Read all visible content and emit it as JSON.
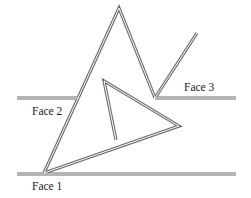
{
  "diagram": {
    "type": "line-drawing",
    "colors": {
      "line_outer": "#6b6b6b",
      "line_inner": "#ffffff",
      "text": "#1a1a1a",
      "background": "#ffffff"
    },
    "labels": {
      "face1": "Face 1",
      "face2": "Face 2",
      "face3": "Face 3"
    },
    "faces": [
      {
        "name": "Face 1",
        "x1": 17,
        "y1": 174,
        "x2": 236,
        "y2": 174
      },
      {
        "name": "Face 2",
        "x1": 17,
        "y1": 98,
        "x2": 78,
        "y2": 98
      },
      {
        "name": "Face 3",
        "x1": 155,
        "y1": 98,
        "x2": 236,
        "y2": 98
      }
    ]
  }
}
